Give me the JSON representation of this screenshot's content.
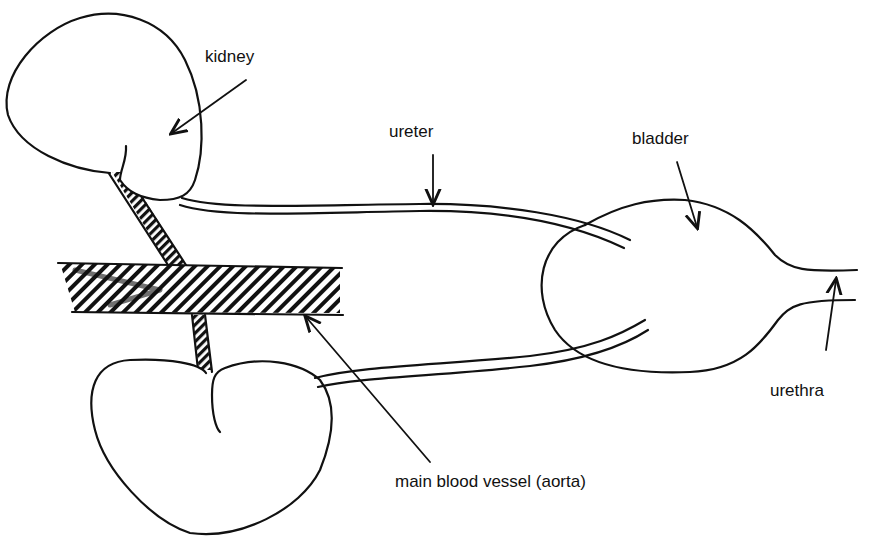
{
  "diagram": {
    "type": "anatomy-line-drawing",
    "labels": {
      "kidney": "kidney",
      "ureter": "ureter",
      "bladder": "bladder",
      "urethra": "urethra",
      "aorta": "main blood vessel (aorta)"
    },
    "colors": {
      "ink": "#111111",
      "background": "#ffffff"
    },
    "parts": [
      "kidney (upper)",
      "kidney (lower)",
      "ureter (upper)",
      "ureter (lower)",
      "bladder",
      "urethra",
      "main blood vessel (aorta)",
      "renal vessels"
    ]
  }
}
